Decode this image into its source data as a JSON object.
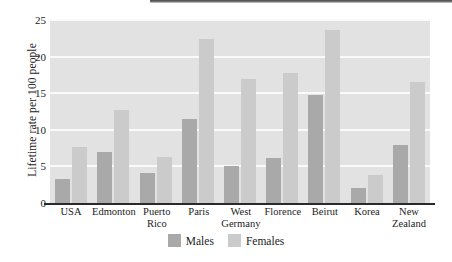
{
  "chart_data": {
    "type": "bar",
    "title": "",
    "xlabel": "",
    "ylabel": "Lifetime rate per 100 people",
    "ylim": [
      0,
      25
    ],
    "yticks": [
      0,
      5,
      10,
      15,
      20,
      25
    ],
    "grid": true,
    "legend_position": "bottom-center",
    "categories": [
      "USA",
      "Edmonton",
      "Puerto Rico",
      "Paris",
      "West Germany",
      "Florence",
      "Beirut",
      "Korea",
      "New Zealand"
    ],
    "category_lines": [
      [
        "USA"
      ],
      [
        "Edmonton"
      ],
      [
        "Puerto",
        "Rico"
      ],
      [
        "Paris"
      ],
      [
        "West",
        "Germany"
      ],
      [
        "Florence"
      ],
      [
        "Beirut"
      ],
      [
        "Korea"
      ],
      [
        "New",
        "Zealand"
      ]
    ],
    "series": [
      {
        "name": "Males",
        "color": "#a9a9a9",
        "values": [
          3.3,
          7.0,
          4.1,
          11.5,
          5.1,
          6.1,
          14.8,
          2.1,
          7.9
        ]
      },
      {
        "name": "Females",
        "color": "#cbcbcb",
        "values": [
          7.7,
          12.7,
          6.3,
          22.4,
          16.9,
          17.8,
          23.6,
          3.8,
          16.5
        ]
      }
    ]
  },
  "axis": {
    "ylabel": "Lifetime rate per 100 people",
    "ytick_labels": [
      "0",
      "5",
      "10",
      "15",
      "20",
      "25"
    ]
  },
  "legend": {
    "entries": [
      {
        "label": "Males",
        "color": "#a9a9a9"
      },
      {
        "label": "Females",
        "color": "#cbcbcb"
      }
    ],
    "males_label": "Females",
    "items": [
      "Males",
      "Females"
    ]
  },
  "colors": {
    "plot_background": "#e2e2e2",
    "gridline": "#fafafa",
    "axis": "#2a2a2a",
    "text": "#1c1c1c",
    "males": "#a9a9a9",
    "females": "#cbcbcb"
  }
}
